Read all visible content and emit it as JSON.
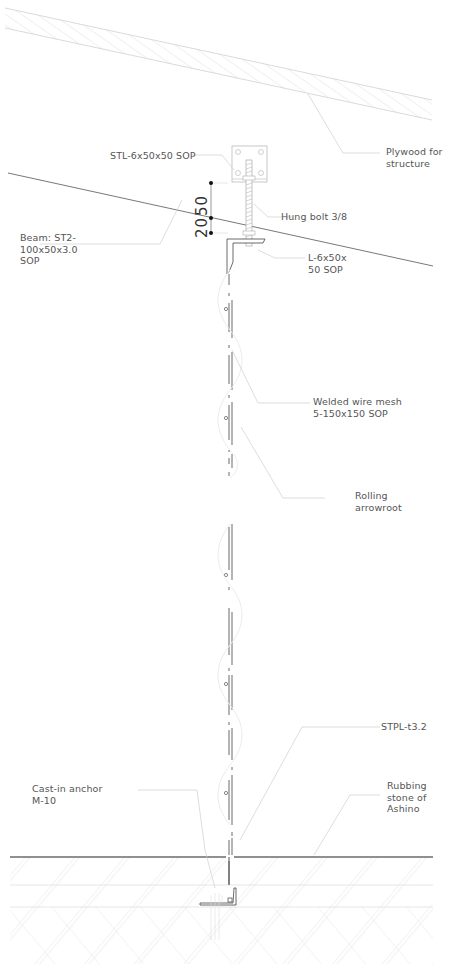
{
  "drawing": {
    "type": "construction-section-detail",
    "labels": {
      "plywood": "Plywood for\nstructure",
      "stl_plate": "STL-6x50x50 SOP",
      "hung_bolt": "Hung bolt 3/8",
      "beam": "Beam: ST2-\n100x50x3.0\nSOP",
      "angle": "L-6x50x\n50 SOP",
      "wire_mesh": "Welded wire mesh\n5-150x150 SOP",
      "rolling": "Rolling\narrowroot",
      "stpl": "STPL-t3.2",
      "anchor": "Cast-in anchor\nM-10",
      "rubbing": "Rubbing\nstone of\nAshino"
    },
    "dimensions": {
      "dim_a": "50",
      "dim_b": "20"
    },
    "colors": {
      "line": "#333333",
      "light_line": "#cccccc",
      "hatch": "#d6d6d6",
      "text": "#555555"
    }
  }
}
